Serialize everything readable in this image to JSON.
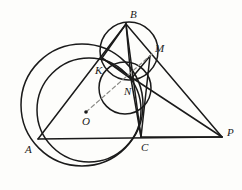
{
  "figure": {
    "kind": "euclidean-geometry-diagram",
    "width": 242,
    "height": 190,
    "background_color": "#fdfdfb",
    "stroke_color": "#1a1a1a",
    "dashed_color": "#8a8a86",
    "bleed_color": "#d9d6d0"
  },
  "points": [
    {
      "id": "A",
      "label": "A",
      "x": 38,
      "y": 139,
      "label_x": 25,
      "label_y": 144,
      "marker": false
    },
    {
      "id": "B",
      "label": "B",
      "x": 126,
      "y": 24,
      "label_x": 130,
      "label_y": 9,
      "marker": false
    },
    {
      "id": "C",
      "label": "C",
      "x": 141,
      "y": 137,
      "label_x": 141,
      "label_y": 142,
      "marker": false
    },
    {
      "id": "K",
      "label": "K",
      "x": 102,
      "y": 58,
      "label_x": 95,
      "label_y": 65,
      "marker": false
    },
    {
      "id": "M",
      "label": "M",
      "x": 150,
      "y": 56,
      "label_x": 155,
      "label_y": 43,
      "marker": false
    },
    {
      "id": "N",
      "label": "N",
      "x": 131,
      "y": 79,
      "label_x": 124,
      "label_y": 86,
      "marker": false
    },
    {
      "id": "O",
      "label": "O",
      "x": 86,
      "y": 112,
      "label_x": 82,
      "label_y": 116,
      "marker": true
    },
    {
      "id": "P",
      "label": "P",
      "x": 222,
      "y": 137,
      "label_x": 227,
      "label_y": 127,
      "marker": false
    }
  ],
  "circles": [
    {
      "id": "circumcircle-ABC",
      "cx": 82,
      "cy": 105,
      "r": 61,
      "note": "large circle centered at O through A, B, C"
    },
    {
      "id": "circle-AKC",
      "cx": 89,
      "cy": 110,
      "r": 52,
      "note": "circle through A, K, C"
    },
    {
      "id": "circle-BKNM",
      "cx": 129,
      "cy": 51,
      "r": 29,
      "note": "small circle through B, K, N, M"
    },
    {
      "id": "circle-KNC",
      "cx": 125,
      "cy": 88,
      "r": 26,
      "note": "circle through K, N, C"
    }
  ],
  "segments": [
    {
      "id": "AB",
      "from": "A",
      "to": "B"
    },
    {
      "id": "AC",
      "from": "A",
      "to": "C"
    },
    {
      "id": "BC",
      "from": "B",
      "to": "C"
    },
    {
      "id": "BP",
      "from": "B",
      "to": "P"
    },
    {
      "id": "CP",
      "from": "C",
      "to": "P"
    },
    {
      "id": "BK",
      "from": "B",
      "to": "K"
    },
    {
      "id": "BN",
      "from": "B",
      "to": "N"
    },
    {
      "id": "KN",
      "from": "K",
      "to": "N"
    },
    {
      "id": "KP",
      "from": "K",
      "to": "P"
    },
    {
      "id": "NM",
      "from": "N",
      "to": "M"
    },
    {
      "id": "NC",
      "from": "N",
      "to": "C"
    },
    {
      "id": "MC",
      "from": "M",
      "to": "C"
    }
  ],
  "dashed_segments": [
    {
      "id": "OM",
      "from": "O",
      "to": "M",
      "note": "dashed ray from centre O through N to M"
    }
  ],
  "bleed_text": {
    "line1": "",
    "line2": ""
  }
}
